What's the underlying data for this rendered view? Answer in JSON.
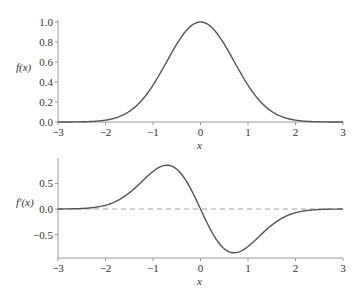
{
  "chart_data": [
    {
      "type": "line",
      "title": "",
      "xlabel": "x",
      "ylabel": "f(x)",
      "xlim": [
        -3,
        3
      ],
      "ylim": [
        0,
        1.0
      ],
      "xticks": [
        "-3",
        "-2",
        "-1",
        "0",
        "1",
        "2",
        "3"
      ],
      "yticks": [
        "0.0",
        "0.2",
        "0.4",
        "0.6",
        "0.8",
        "1.0"
      ],
      "grid": false,
      "series": [
        {
          "name": "f(x) = exp(-x^2)",
          "x": [
            -3,
            -2.5,
            -2,
            -1.5,
            -1,
            -0.5,
            0,
            0.5,
            1,
            1.5,
            2,
            2.5,
            3
          ],
          "values": [
            0.0001,
            0.0019,
            0.0183,
            0.1054,
            0.3679,
            0.7788,
            1.0,
            0.7788,
            0.3679,
            0.1054,
            0.0183,
            0.0019,
            0.0001
          ],
          "color": "#555555"
        }
      ]
    },
    {
      "type": "line",
      "title": "",
      "xlabel": "x",
      "ylabel": "f'(x)",
      "xlim": [
        -3,
        3
      ],
      "ylim": [
        -0.96,
        0.96
      ],
      "xticks": [
        "-3",
        "-2",
        "-1",
        "0",
        "1",
        "2",
        "3"
      ],
      "yticks": [
        "-0.5",
        "0.0",
        "0.5"
      ],
      "grid": false,
      "annotations": [
        "dashed horizontal line at y = 0"
      ],
      "series": [
        {
          "name": "f'(x) = -2x exp(-x^2)",
          "x": [
            -3,
            -2.5,
            -2,
            -1.5,
            -1,
            -0.707,
            -0.5,
            0,
            0.5,
            0.707,
            1,
            1.5,
            2,
            2.5,
            3
          ],
          "values": [
            0.0007,
            0.0097,
            0.0733,
            0.3162,
            0.7358,
            0.8578,
            0.7788,
            0.0,
            -0.7788,
            -0.8578,
            -0.7358,
            -0.3162,
            -0.0733,
            -0.0097,
            -0.0007
          ],
          "color": "#555555"
        }
      ]
    }
  ]
}
